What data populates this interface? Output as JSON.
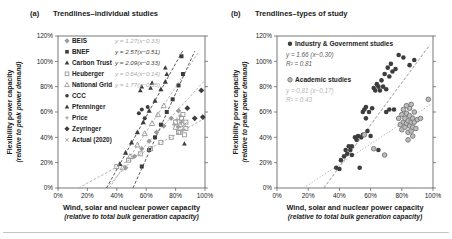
{
  "colors": {
    "dark_marker": "#3d3d3d",
    "light_marker": "#9a9a9a",
    "text": "#1a1a1a",
    "divider": "#c6c6c6"
  },
  "chart_data": [
    {
      "type": "scatter",
      "panel_label": "(a)",
      "title": "Trendlines–individual studies",
      "xlabel": "Wind, solar and nuclear power capacity",
      "xlabel_sub": "(relative to total bulk generation capacity)",
      "ylabel": "Flexibility power capacity",
      "ylabel_sub": "(relative to peak power demand)",
      "x_ticks": [
        "0%",
        "20%",
        "40%",
        "60%",
        "80%",
        "100%"
      ],
      "y_ticks": [
        "0%",
        "20%",
        "40%",
        "60%",
        "80%",
        "100%",
        "120%"
      ],
      "xlim": [
        0,
        1.0
      ],
      "ylim": [
        0,
        1.2
      ],
      "grid": false,
      "legend_position": "top-left-inside",
      "series": [
        {
          "name": "BEIS",
          "marker": "diamond",
          "color": "#9a9a9a",
          "size": 3.8,
          "equation": "y = 1.27(x−0.33)",
          "eq_color": "#ababab",
          "trend": {
            "x1": 0.33,
            "y1": 0,
            "x2": 1.0,
            "y2": 0.851,
            "color": "#ababab",
            "dash": "2.5,1.8"
          },
          "points": [
            [
              0.46,
              0.16
            ],
            [
              0.52,
              0.25
            ],
            [
              0.57,
              0.31
            ],
            [
              0.62,
              0.37
            ],
            [
              0.67,
              0.44
            ],
            [
              0.72,
              0.49
            ],
            [
              0.77,
              0.55
            ],
            [
              0.82,
              0.61
            ]
          ]
        },
        {
          "name": "BNEF",
          "marker": "square",
          "color": "#3d3d3d",
          "size": 4,
          "equation": "y = 2.57(x−0.51)",
          "eq_color": "#3d3d3d",
          "trend": {
            "x1": 0.51,
            "y1": 0,
            "x2": 0.93,
            "y2": 1.08,
            "color": "#4a4a4a",
            "dash": "3,1.8"
          },
          "points": [
            [
              0.57,
              0.17
            ],
            [
              0.62,
              0.3
            ],
            [
              0.66,
              0.4
            ],
            [
              0.7,
              0.5
            ],
            [
              0.74,
              0.6
            ],
            [
              0.78,
              0.7
            ],
            [
              0.82,
              0.81
            ],
            [
              0.85,
              0.9
            ],
            [
              0.84,
              1.04
            ]
          ]
        },
        {
          "name": "Carbon Trust",
          "marker": "triangle",
          "color": "#3d3d3d",
          "size": 4.2,
          "equation": "y = 2.09(x−0.33)",
          "eq_color": "#3d3d3d",
          "trend": {
            "x1": 0.33,
            "y1": 0,
            "x2": 0.847,
            "y2": 1.08,
            "color": "#4a4a4a",
            "dash": "3,1.8"
          },
          "points": [
            [
              0.42,
              0.19
            ],
            [
              0.46,
              0.28
            ],
            [
              0.5,
              0.36
            ],
            [
              0.54,
              0.44
            ],
            [
              0.58,
              0.52
            ],
            [
              0.62,
              0.61
            ],
            [
              0.66,
              0.69
            ],
            [
              0.7,
              0.78
            ],
            [
              0.73,
              0.84
            ]
          ]
        },
        {
          "name": "Heuberger",
          "marker": "open-square",
          "color": "#9a9a9a",
          "size": 4,
          "equation": "y = 0.64(x−0.14)",
          "eq_color": "#ababab",
          "trend": {
            "x1": 0.14,
            "y1": 0,
            "x2": 1.0,
            "y2": 0.55,
            "color": "#ababab",
            "dash": "2.5,1.8"
          },
          "points": [
            [
              0.4,
              0.17
            ],
            [
              0.48,
              0.22
            ],
            [
              0.56,
              0.27
            ],
            [
              0.63,
              0.31
            ],
            [
              0.7,
              0.36
            ],
            [
              0.77,
              0.4
            ],
            [
              0.83,
              0.44
            ],
            [
              0.87,
              0.47
            ],
            [
              0.8,
              0.52
            ],
            [
              0.82,
              0.44
            ],
            [
              0.84,
              0.55
            ],
            [
              0.86,
              0.42
            ],
            [
              0.85,
              0.58
            ],
            [
              0.87,
              0.52
            ]
          ]
        },
        {
          "name": "National Grid",
          "marker": "open-triangle",
          "color": "#9a9a9a",
          "size": 4.2,
          "equation": "y = 1.77(x−0.35)",
          "eq_color": "#ababab",
          "trend": {
            "x1": 0.35,
            "y1": 0,
            "x2": 0.96,
            "y2": 1.08,
            "color": "#ababab",
            "dash": "2.5,1.8"
          },
          "points": [
            [
              0.44,
              0.16
            ],
            [
              0.49,
              0.25
            ],
            [
              0.54,
              0.34
            ],
            [
              0.59,
              0.43
            ],
            [
              0.64,
              0.51
            ],
            [
              0.68,
              0.58
            ],
            [
              0.72,
              0.65
            ],
            [
              0.8,
              0.48
            ],
            [
              0.83,
              0.5
            ]
          ]
        },
        {
          "name": "CCC",
          "marker": "circle",
          "color": "#3d3d3d",
          "size": 4,
          "points": [
            [
              0.55,
              0.59
            ],
            [
              0.57,
              0.62
            ],
            [
              0.59,
              0.55
            ],
            [
              0.61,
              0.64
            ]
          ]
        },
        {
          "name": "Pfenninger",
          "marker": "triangle",
          "color": "#3d3d3d",
          "size": 3.8,
          "points": [
            [
              0.56,
              0.77
            ],
            [
              0.57,
              0.8
            ],
            [
              0.63,
              0.79
            ],
            [
              0.64,
              0.83
            ],
            [
              0.73,
              0.95
            ],
            [
              0.74,
              0.9
            ],
            [
              0.86,
              0.35
            ]
          ]
        },
        {
          "name": "Price",
          "marker": "plus",
          "color": "#9a9a9a",
          "size": 4.6,
          "points": [
            [
              0.79,
              0.5
            ],
            [
              0.81,
              0.54
            ],
            [
              0.82,
              0.48
            ],
            [
              0.83,
              0.57
            ],
            [
              0.84,
              0.52
            ],
            [
              0.85,
              0.46
            ]
          ]
        },
        {
          "name": "Zeyringer",
          "marker": "diamond",
          "color": "#3d3d3d",
          "size": 4.2,
          "points": [
            [
              0.88,
              0.63
            ],
            [
              0.93,
              0.55
            ],
            [
              0.985,
              0.56
            ],
            [
              0.975,
              0.77
            ]
          ]
        },
        {
          "name": "Actual (2020)",
          "marker": "x",
          "color": "#9a9a9a",
          "size": 4.6,
          "points": [
            [
              0.82,
              0.49
            ],
            [
              0.84,
              0.53
            ],
            [
              0.86,
              0.5
            ]
          ]
        }
      ]
    },
    {
      "type": "scatter",
      "panel_label": "(b)",
      "title": "Trendlines–types of study",
      "xlabel": "Wind, solar and nuclear power capacity",
      "xlabel_sub": "(relative to total bulk generation capacity)",
      "ylabel": "Flexibility power capacity",
      "ylabel_sub": "(relative to peak power demand)",
      "x_ticks": [
        "0%",
        "20%",
        "40%",
        "60%",
        "80%",
        "100%"
      ],
      "y_ticks": [
        "0%",
        "20%",
        "40%",
        "60%",
        "80%",
        "100%",
        "120%"
      ],
      "xlim": [
        0,
        1.0
      ],
      "ylim": [
        0,
        1.2
      ],
      "grid": false,
      "legend_position": "top-left-inside",
      "series": [
        {
          "name": "Industry & Government studies",
          "marker": "circle",
          "color": "#3d3d3d",
          "size": 4.6,
          "equation": "y = 1.66 (x−0.30)",
          "r2": "R² = 0.81",
          "eq_color": "#5a5a5a",
          "trend": {
            "x1": 0.3,
            "y1": 0,
            "x2": 0.98,
            "y2": 1.13,
            "color": "#8a8a8a",
            "dash": "3,1.8"
          },
          "points": [
            [
              0.38,
              0.16
            ],
            [
              0.4,
              0.15
            ],
            [
              0.41,
              0.22
            ],
            [
              0.43,
              0.25
            ],
            [
              0.44,
              0.3
            ],
            [
              0.45,
              0.27
            ],
            [
              0.46,
              0.33
            ],
            [
              0.47,
              0.3
            ],
            [
              0.48,
              0.26
            ],
            [
              0.48,
              0.33
            ],
            [
              0.5,
              0.4
            ],
            [
              0.51,
              0.38
            ],
            [
              0.52,
              0.41
            ],
            [
              0.53,
              0.16
            ],
            [
              0.54,
              0.4
            ],
            [
              0.55,
              0.42
            ],
            [
              0.55,
              0.6
            ],
            [
              0.56,
              0.62
            ],
            [
              0.57,
              0.55
            ],
            [
              0.57,
              0.64
            ],
            [
              0.58,
              0.45
            ],
            [
              0.59,
              0.6
            ],
            [
              0.6,
              0.41
            ],
            [
              0.61,
              0.63
            ],
            [
              0.62,
              0.79
            ],
            [
              0.63,
              0.77
            ],
            [
              0.64,
              0.82
            ],
            [
              0.65,
              0.3
            ],
            [
              0.65,
              0.8
            ],
            [
              0.66,
              0.77
            ],
            [
              0.67,
              0.85
            ],
            [
              0.68,
              0.8
            ],
            [
              0.69,
              0.9
            ],
            [
              0.7,
              0.78
            ],
            [
              0.7,
              0.6
            ],
            [
              0.71,
              0.95
            ],
            [
              0.72,
              0.62
            ],
            [
              0.72,
              0.88
            ],
            [
              0.73,
              0.98
            ],
            [
              0.74,
              0.92
            ],
            [
              0.75,
              0.62
            ],
            [
              0.76,
              0.94
            ],
            [
              0.78,
              1.05
            ],
            [
              0.81,
              1.03
            ],
            [
              0.85,
              0.97
            ],
            [
              0.88,
              1.01
            ]
          ]
        },
        {
          "name": "Academic studies",
          "marker": "ring",
          "color": "#7d7d7d",
          "ring_fill": "#bdbdbd",
          "size": 4.6,
          "equation": "y = 0.81 (x−0.17)",
          "r2": "R² = 0.43",
          "eq_color": "#b5b5b5",
          "trend": {
            "x1": 0.17,
            "y1": 0,
            "x2": 1.0,
            "y2": 0.672,
            "color": "#b0b0b0",
            "dash": "1.4,1.8"
          },
          "points": [
            [
              0.78,
              0.55
            ],
            [
              0.79,
              0.5
            ],
            [
              0.8,
              0.58
            ],
            [
              0.8,
              0.46
            ],
            [
              0.81,
              0.52
            ],
            [
              0.81,
              0.62
            ],
            [
              0.82,
              0.48
            ],
            [
              0.82,
              0.55
            ],
            [
              0.83,
              0.51
            ],
            [
              0.83,
              0.59
            ],
            [
              0.84,
              0.44
            ],
            [
              0.84,
              0.53
            ],
            [
              0.85,
              0.49
            ],
            [
              0.85,
              0.57
            ],
            [
              0.86,
              0.52
            ],
            [
              0.86,
              0.45
            ],
            [
              0.87,
              0.55
            ],
            [
              0.87,
              0.48
            ],
            [
              0.88,
              0.52
            ],
            [
              0.88,
              0.6
            ],
            [
              0.89,
              0.47
            ],
            [
              0.9,
              0.54
            ],
            [
              0.85,
              0.63
            ],
            [
              0.83,
              0.65
            ],
            [
              0.86,
              0.66
            ],
            [
              0.84,
              0.38
            ],
            [
              0.87,
              0.41
            ],
            [
              0.92,
              0.55
            ],
            [
              0.97,
              0.7
            ],
            [
              0.69,
              0.26
            ],
            [
              0.62,
              0.31
            ],
            [
              0.56,
              0.42
            ]
          ]
        }
      ]
    }
  ]
}
